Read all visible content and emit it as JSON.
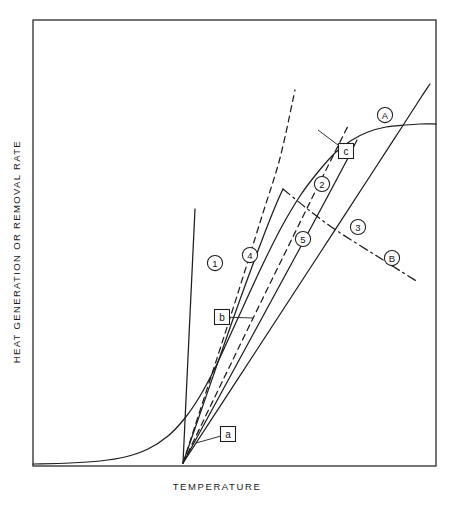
{
  "figure": {
    "top_note": "",
    "frame": {
      "x": 33,
      "y": 20,
      "width": 403,
      "height": 446,
      "color": "#3a3a3a"
    }
  },
  "axes": {
    "ylabel": "HEAT GENERATION OR REMOVAL RATE",
    "xlabel": "TEMPERATURE"
  },
  "labels": {
    "circled": [
      {
        "text": "1",
        "x": 215,
        "y": 263
      },
      {
        "text": "4",
        "x": 250,
        "y": 255
      },
      {
        "text": "5",
        "x": 303,
        "y": 239
      },
      {
        "text": "2",
        "x": 322,
        "y": 184
      },
      {
        "text": "3",
        "x": 358,
        "y": 227
      },
      {
        "text": "A",
        "x": 385,
        "y": 115
      },
      {
        "text": "B",
        "x": 392,
        "y": 258
      }
    ],
    "boxed": [
      {
        "text": "a",
        "x": 228,
        "y": 434
      },
      {
        "text": "b",
        "x": 222,
        "y": 317
      },
      {
        "text": "c",
        "x": 346,
        "y": 151
      }
    ]
  },
  "chart_data": {
    "type": "line",
    "title": "",
    "xlabel": "TEMPERATURE",
    "ylabel": "HEAT GENERATION OR REMOVAL RATE",
    "grid": false,
    "legend": "none",
    "axis_ranges": {
      "x": [
        0,
        1
      ],
      "y": [
        0,
        1
      ]
    },
    "series": [
      {
        "name": "A",
        "label": "A",
        "style": "solid",
        "role": "heat-generation-sigmoid",
        "points": [
          [
            33,
            464
          ],
          [
            70,
            463
          ],
          [
            100,
            461
          ],
          [
            125,
            457
          ],
          [
            148,
            449
          ],
          [
            168,
            436
          ],
          [
            185,
            418
          ],
          [
            200,
            396
          ],
          [
            214,
            370
          ],
          [
            228,
            340
          ],
          [
            244,
            305
          ],
          [
            262,
            266
          ],
          [
            281,
            228
          ],
          [
            300,
            196
          ],
          [
            318,
            172
          ],
          [
            336,
            152
          ],
          [
            352,
            140
          ],
          [
            368,
            132
          ],
          [
            386,
            127
          ],
          [
            405,
            125
          ],
          [
            420,
            124
          ],
          [
            436,
            124
          ]
        ]
      },
      {
        "name": "B",
        "label": "B",
        "style": "dashdot",
        "role": "descending-dashdot",
        "points": [
          [
            283,
            189
          ],
          [
            305,
            207
          ],
          [
            330,
            226
          ],
          [
            356,
            243
          ],
          [
            380,
            258
          ],
          [
            402,
            272
          ],
          [
            418,
            282
          ]
        ]
      },
      {
        "name": "1",
        "label": "1",
        "style": "solid",
        "role": "removal-line-steep",
        "points": [
          [
            183,
            463
          ],
          [
            195,
            209
          ]
        ]
      },
      {
        "name": "2",
        "label": "2",
        "style": "solid",
        "role": "removal-line",
        "points": [
          [
            183,
            463
          ],
          [
            232,
            322
          ],
          [
            262,
            240
          ],
          [
            275,
            207
          ],
          [
            283,
            189
          ]
        ]
      },
      {
        "name": "3",
        "label": "3",
        "style": "solid",
        "role": "removal-line-shallow",
        "points": [
          [
            183,
            463
          ],
          [
            260,
            345
          ],
          [
            320,
            253
          ],
          [
            374,
            170
          ],
          [
            400,
            130
          ],
          [
            420,
            99
          ],
          [
            430,
            84
          ]
        ]
      },
      {
        "name": "4",
        "label": "4",
        "style": "dashed",
        "role": "tangent-line-b",
        "points": [
          [
            183,
            463
          ],
          [
            230,
            318
          ],
          [
            262,
            216
          ],
          [
            280,
            158
          ],
          [
            295,
            90
          ]
        ]
      },
      {
        "name": "5",
        "label": "5",
        "style": "dashed",
        "role": "tangent-line",
        "points": [
          [
            183,
            463
          ],
          [
            240,
            345
          ],
          [
            285,
            253
          ],
          [
            318,
            186
          ],
          [
            338,
            146
          ],
          [
            348,
            126
          ]
        ]
      },
      {
        "name": "c-tangent",
        "label": "",
        "style": "solid",
        "role": "tangent-line-c",
        "points": [
          [
            183,
            463
          ],
          [
            250,
            340
          ],
          [
            300,
            248
          ],
          [
            330,
            192
          ],
          [
            348,
            158
          ],
          [
            357,
            140
          ]
        ]
      }
    ],
    "annotations": [
      {
        "text": "a",
        "type": "boxed",
        "x": 228,
        "y": 434,
        "points_to": [
          196,
          443
        ]
      },
      {
        "text": "b",
        "type": "boxed",
        "x": 222,
        "y": 317,
        "points_to": [
          253,
          318
        ]
      },
      {
        "text": "c",
        "type": "boxed",
        "x": 346,
        "y": 151,
        "points_to": [
          318,
          130
        ]
      }
    ]
  }
}
